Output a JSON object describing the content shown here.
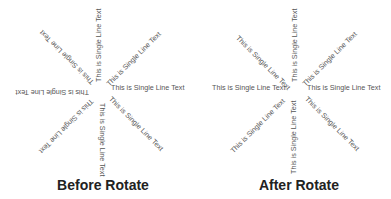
{
  "label_text": "This is Single Line Text",
  "colors": {
    "label": "#555555",
    "caption": "#222222",
    "background": "#ffffff"
  },
  "panels": [
    {
      "id": "before",
      "caption": "Before Rotate",
      "labels": [
        {
          "angle_deg": 0,
          "text": "This is Single Line Text"
        },
        {
          "angle_deg": 45,
          "text": "This is Single Line Text"
        },
        {
          "angle_deg": 90,
          "text": "This is Single Line Text"
        },
        {
          "angle_deg": 135,
          "text": "This is Single Line Text"
        },
        {
          "angle_deg": 180,
          "text": "This is Single Line Text"
        },
        {
          "angle_deg": 225,
          "text": "This is Single Line Text"
        },
        {
          "angle_deg": 270,
          "text": "This is Single Line Text"
        },
        {
          "angle_deg": 315,
          "text": "This is Single Line Text"
        }
      ]
    },
    {
      "id": "after",
      "caption": "After Rotate",
      "labels": [
        {
          "angle_deg": 0,
          "text": "This is Single Line Text"
        },
        {
          "angle_deg": 45,
          "text": "This is Single Line Text"
        },
        {
          "angle_deg": 90,
          "text": "This is Single Line Text"
        },
        {
          "angle_deg": 135,
          "text": "This is Single Line Text"
        },
        {
          "angle_deg": 180,
          "text": "This is Single Line Text"
        },
        {
          "angle_deg": 225,
          "text": "This is Single Line Text"
        },
        {
          "angle_deg": 270,
          "text": "This is Single Line Text"
        },
        {
          "angle_deg": 315,
          "text": "This is Single Line Text"
        }
      ]
    }
  ]
}
